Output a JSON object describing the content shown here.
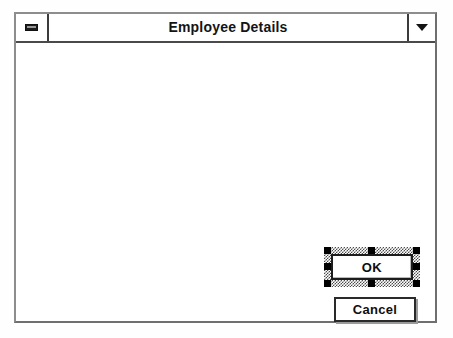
{
  "window": {
    "title": "Employee Details",
    "system_menu_icon": "minimize-bar-icon",
    "restore_icon": "chevron-down-icon"
  },
  "client": {
    "background_color": "#ffffff",
    "controls": [
      {
        "type": "button",
        "name": "ok-button",
        "label": "OK",
        "selected": true,
        "handle_count": 8
      },
      {
        "type": "button",
        "name": "cancel-button",
        "label": "Cancel",
        "selected": false,
        "handle_count": 0
      }
    ]
  },
  "colors": {
    "frame": "#6f6f6f",
    "title_text": "#141414",
    "handle": "#000000",
    "selection_band": "#4d4d4d",
    "button_face": "#ffffff"
  }
}
